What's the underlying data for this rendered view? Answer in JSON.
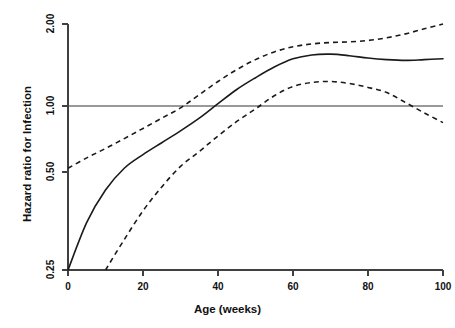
{
  "chart_data": {
    "type": "line",
    "title": "",
    "xlabel": "Age (weeks)",
    "ylabel": "Hazard ratio for Infection",
    "xlim": [
      0,
      100
    ],
    "ylim": [
      0.25,
      2.0
    ],
    "yscale": "log",
    "grid": false,
    "legend": null,
    "xticks": [
      0,
      20,
      40,
      60,
      80,
      100
    ],
    "xtick_labels": [
      "0",
      "20",
      "40",
      "60",
      "80",
      "100"
    ],
    "yticks": [
      0.25,
      0.5,
      1.0,
      2.0
    ],
    "ytick_labels": [
      "0.25",
      "0.50",
      "1.00",
      "2.00"
    ],
    "reference_line": {
      "y": 1.0,
      "label": "1.00",
      "color": "#999999",
      "style": "solid"
    },
    "x": [
      0,
      5,
      10,
      15,
      20,
      25,
      30,
      35,
      40,
      45,
      50,
      55,
      60,
      65,
      70,
      75,
      80,
      85,
      90,
      95,
      100
    ],
    "series": [
      {
        "name": "Hazard ratio (smoothed estimate)",
        "style": "solid",
        "color": "#1a1a1a",
        "values": [
          0.25,
          0.35,
          0.44,
          0.52,
          0.6,
          0.68,
          0.77,
          0.88,
          1.02,
          1.15,
          1.27,
          1.39,
          1.49,
          1.54,
          1.55,
          1.53,
          1.5,
          1.48,
          1.47,
          1.48,
          1.49
        ]
      },
      {
        "name": "Upper 95% confidence limit",
        "style": "dashed",
        "color": "#1a1a1a",
        "values": [
          0.52,
          0.58,
          0.64,
          0.71,
          0.79,
          0.88,
          0.98,
          1.1,
          1.23,
          1.36,
          1.48,
          1.58,
          1.65,
          1.69,
          1.71,
          1.72,
          1.74,
          1.78,
          1.84,
          1.92,
          2.0
        ]
      },
      {
        "name": "Lower 95% confidence limit",
        "style": "dashed",
        "color": "#1a1a1a",
        "values": [
          null,
          null,
          0.25,
          0.31,
          0.38,
          0.45,
          0.53,
          0.62,
          0.73,
          0.85,
          0.97,
          1.09,
          1.18,
          1.22,
          1.23,
          1.21,
          1.17,
          1.12,
          1.03,
          0.93,
          0.84
        ]
      }
    ],
    "annotations": []
  },
  "axis": {
    "x_title": "Age (weeks)",
    "y_title": "Hazard ratio for Infection"
  }
}
